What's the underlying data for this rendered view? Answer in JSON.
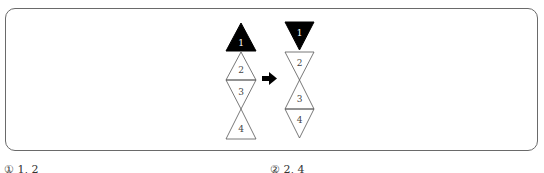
{
  "diagram": {
    "left_stack": [
      {
        "label": "1",
        "filled": true,
        "direction": "up"
      },
      {
        "label": "2",
        "filled": false,
        "direction": "up"
      },
      {
        "label": "3",
        "filled": false,
        "direction": "down"
      },
      {
        "label": "4",
        "filled": false,
        "direction": "up"
      }
    ],
    "right_stack": [
      {
        "label": "1",
        "filled": true,
        "direction": "down"
      },
      {
        "label": "2",
        "filled": false,
        "direction": "down"
      },
      {
        "label": "3",
        "filled": false,
        "direction": "up"
      },
      {
        "label": "4",
        "filled": false,
        "direction": "down"
      }
    ],
    "arrow": "right-arrow"
  },
  "options": {
    "left": "① 1, 2",
    "right": "② 2, 4"
  },
  "colors": {
    "fill": "#000000",
    "stroke": "#555555",
    "frame": "#6a6a6a"
  }
}
